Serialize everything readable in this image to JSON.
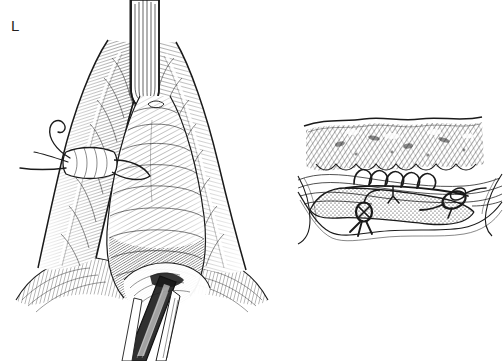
{
  "figure": {
    "type": "medical-surgical-illustration",
    "style": "pen-and-ink line engraving",
    "background_color": "#ffffff",
    "ink_color": "#1a1a1a",
    "label_color": "#231f20",
    "width": 504,
    "height": 361,
    "panel_count": 2
  },
  "panels": [
    {
      "id": "L",
      "label": "L",
      "label_position": {
        "x": 11,
        "y": 18
      },
      "view": "external surgical field, anterior view",
      "description": "Vertically oriented operative field with retracted tissue flaps forming an inverted V, a blade-like retractor descending from the top, a traction suture with free thread tails clipped to the left tissue edge, and a dark tubular structure emerging at the lower center.",
      "elements": [
        {
          "name": "retractor-blade",
          "note": "vertical instrument entering from top center"
        },
        {
          "name": "left-tissue-flap",
          "note": "hatched tissue retracted to the left"
        },
        {
          "name": "right-tissue-flap",
          "note": "hatched tissue retracted to the right"
        },
        {
          "name": "central-tissue-mass",
          "note": "pale midline structure with fine contour hatching"
        },
        {
          "name": "traction-suture",
          "note": "suture loop with two free thread tails extending left"
        },
        {
          "name": "tubular-structure",
          "note": "dark catheter or duct exiting at bottom center"
        },
        {
          "name": "perineal-skin",
          "note": "shaded skin surfaces at lower left and lower right"
        }
      ]
    },
    {
      "id": "M",
      "label": "M",
      "label_position": {
        "x": 306,
        "y": 72
      },
      "view": "sagittal cross-section",
      "description": "Cross-sectional layer diagram: a wavy surface contour over diagonally hatched muscle tissue, a stippled mucosal band below, an arcade of small suture loops bridging the layers, and two tied suture knots with radiating thread tails.",
      "elements": [
        {
          "name": "surface-contour-line",
          "note": "wavy outer skin edge"
        },
        {
          "name": "hatched-muscle-layer",
          "note": "diagonal line hatching"
        },
        {
          "name": "stippled-mucosal-band",
          "note": "dotted tissue band"
        },
        {
          "name": "suture-arcade",
          "note": "row of five small continuous suture loops"
        },
        {
          "name": "left-suture-knot",
          "note": "tied knot with thread tails"
        },
        {
          "name": "right-suture-loop",
          "note": "looped suture passing through tissue"
        }
      ]
    }
  ]
}
